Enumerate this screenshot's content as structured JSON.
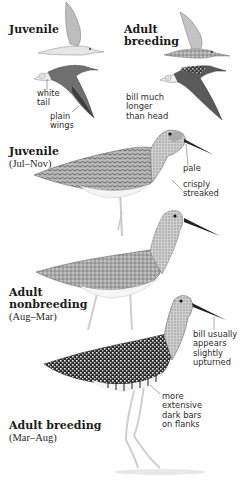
{
  "plate": {
    "flight": {
      "juvenile_label": "Juvenile",
      "adult_label_line1": "Adult",
      "adult_label_line2": "breeding",
      "annotations": {
        "white_tail": "white\ntail",
        "plain_wings": "plain\nwings",
        "bill_longer": "bill much\nlonger\nthan head"
      }
    },
    "juvenile": {
      "label": "Juvenile",
      "season": "(Jul–Nov)",
      "annotations": {
        "pale": "pale",
        "crisply_streaked": "crisply\nstreaked"
      }
    },
    "adult_nonbreeding": {
      "label_line1": "Adult",
      "label_line2": "nonbreeding",
      "season": "(Aug–Mar)"
    },
    "adult_breeding": {
      "label": "Adult breeding",
      "season": "(Mar–Aug)",
      "annotations": {
        "bill_upturned": "bill usually\nappears\nslightly\nupturned",
        "dark_bars": "more\nextensive\ndark bars\non flanks"
      }
    }
  },
  "colors": {
    "ink": "#1a1a1a",
    "plumage_dark": "#3a3a3a",
    "plumage_mid": "#8a8a8a",
    "plumage_light": "#d8d8d8",
    "leg": "#c9c9c9"
  }
}
